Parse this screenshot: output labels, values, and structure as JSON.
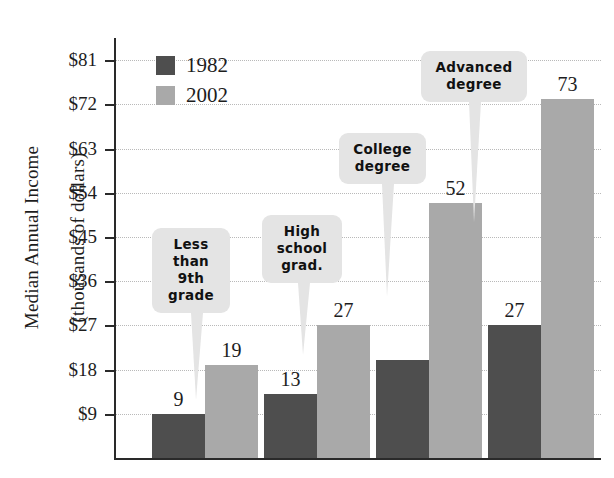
{
  "chart_data": {
    "type": "bar",
    "title": "",
    "xlabel": "",
    "ylabel": "Median Annual Income (thousands of dollars)",
    "ylabel_line1": "Median Annual Income",
    "ylabel_line2": "(thousands of dollars)",
    "ylim": [
      0,
      85.5
    ],
    "y_ticks": [
      "$9",
      "$18",
      "$27",
      "$36",
      "$45",
      "$54",
      "$63",
      "$72",
      "$81"
    ],
    "y_tick_values": [
      9,
      18,
      27,
      36,
      45,
      54,
      63,
      72,
      81
    ],
    "grid": true,
    "legend_position": "upper-left-inside",
    "categories": [
      "Less than 9th grade",
      "High school grad.",
      "College degree",
      "Advanced degree"
    ],
    "series": [
      {
        "name": "1982",
        "color": "#4e4e4e",
        "values": [
          9,
          13,
          20,
          27
        ],
        "labels": [
          "9",
          "13",
          "",
          "27"
        ]
      },
      {
        "name": "2002",
        "color": "#a9a9a9",
        "values": [
          19,
          27,
          52,
          73
        ],
        "labels": [
          "19",
          "27",
          "52",
          "73"
        ]
      }
    ],
    "annotations": [
      {
        "text": "Less\nthan\n9th\ngrade",
        "target": "Less than 9th grade"
      },
      {
        "text": "High\nschool\ngrad.",
        "target": "High school grad."
      },
      {
        "text": "College\ndegree",
        "target": "College degree"
      },
      {
        "text": "Advanced\ndegree",
        "target": "Advanced degree"
      }
    ]
  },
  "legend": {
    "items": [
      {
        "label": "1982",
        "color": "#4e4e4e"
      },
      {
        "label": "2002",
        "color": "#a9a9a9"
      }
    ]
  },
  "colors": {
    "series_1982": "#4e4e4e",
    "series_2002": "#a9a9a9",
    "callout_bg": "#e4e4e4",
    "axis": "#2a2a2a",
    "gridline": "#b9b9b9",
    "text": "#1d1d1d",
    "background": "#ffffff"
  }
}
